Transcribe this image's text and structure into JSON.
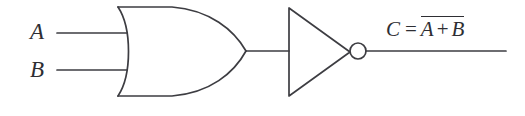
{
  "figure": {
    "kind": "logic-gate-diagram",
    "background_color": "#ffffff",
    "line_color": "#3d3d42",
    "text_color": "#2e2e33"
  },
  "inputs": [
    {
      "id": "a",
      "label": "A"
    },
    {
      "id": "b",
      "label": "B"
    }
  ],
  "gates": [
    {
      "id": "or-gate",
      "type": "OR",
      "shape": "curved-back-pointed-nose"
    },
    {
      "id": "inverter",
      "type": "NOT",
      "shape": "triangle-with-bubble"
    }
  ],
  "output": {
    "lhs": "C",
    "equals": "=",
    "operand_left": "A",
    "operator": "+",
    "operand_right": "B",
    "overline": true,
    "full_text": "C = A + B (complemented)"
  }
}
